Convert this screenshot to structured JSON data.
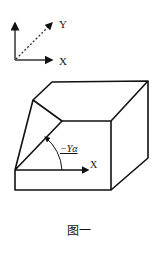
{
  "figure": {
    "caption": "图一",
    "axes_legend": {
      "y_label": "Y",
      "x_label": "X"
    },
    "box": {
      "angle_label": "−Yα",
      "x_label": "X"
    },
    "colors": {
      "line": "#111111",
      "background": "#ffffff",
      "caption_box": "#555555"
    }
  }
}
